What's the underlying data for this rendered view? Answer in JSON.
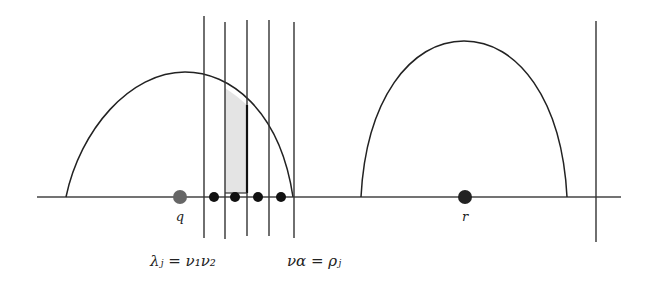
{
  "diagram": {
    "axis": {
      "x1": 37,
      "x2": 621,
      "y": 197,
      "color": "#444444"
    },
    "arches": [
      {
        "name": "left-arch",
        "foot_left": 66,
        "peak_x": 185,
        "peak_y": 72,
        "foot_right": 293
      },
      {
        "name": "right-arch",
        "foot_left": 361,
        "peak_x": 464,
        "peak_y": 41,
        "foot_right": 567
      }
    ],
    "vertical_lines": [
      {
        "x": 204,
        "top": 16,
        "bottom": 238
      },
      {
        "x": 225,
        "top": 22,
        "bottom": 239
      },
      {
        "x": 247,
        "top": 20,
        "bottom": 236
      },
      {
        "x": 269,
        "top": 20,
        "bottom": 236
      },
      {
        "x": 294,
        "top": 22,
        "bottom": 238
      },
      {
        "x": 596,
        "top": 21,
        "bottom": 242
      }
    ],
    "shaded_region": {
      "x_left": 225,
      "x_right": 247,
      "bottom": 193,
      "fill": "#e4e4e4"
    },
    "points": [
      {
        "label": "q",
        "x": 180,
        "y": 197,
        "r": 7,
        "color": "#666666"
      },
      {
        "label": "",
        "x": 214,
        "y": 197,
        "r": 5,
        "color": "#111111"
      },
      {
        "label": "",
        "x": 235,
        "y": 197,
        "r": 5,
        "color": "#111111"
      },
      {
        "label": "",
        "x": 258,
        "y": 197,
        "r": 5,
        "color": "#111111"
      },
      {
        "label": "",
        "x": 281,
        "y": 197,
        "r": 5,
        "color": "#111111"
      },
      {
        "label": "r",
        "x": 465,
        "y": 197,
        "r": 7,
        "color": "#222222"
      }
    ],
    "point_labels": {
      "q": "q",
      "r": "r"
    },
    "equations": {
      "lambda_eq": "λⱼ = ν₁ν₂",
      "nu_eq": "να = ρⱼ"
    }
  }
}
